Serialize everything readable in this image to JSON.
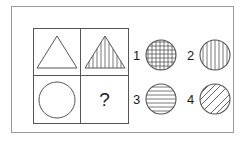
{
  "puzzle": {
    "type": "visual-analogy-matrix",
    "frame": {
      "stroke": "#9a9a9a"
    },
    "matrix": {
      "stroke": "#555555",
      "cells": [
        {
          "position": "top-left",
          "shape": "triangle",
          "fill_pattern": "none",
          "label": "triangle-outline"
        },
        {
          "position": "top-right",
          "shape": "triangle",
          "fill_pattern": "vertical-lines",
          "label": "triangle-vertical-hatch"
        },
        {
          "position": "bottom-left",
          "shape": "circle",
          "fill_pattern": "none",
          "label": "circle-outline"
        },
        {
          "position": "bottom-right",
          "shape": "question",
          "fill_pattern": "none",
          "label": "?"
        }
      ]
    },
    "options": [
      {
        "number": "1",
        "shape": "circle",
        "fill_pattern": "cross-hatch",
        "label": "circle-grid"
      },
      {
        "number": "2",
        "shape": "circle",
        "fill_pattern": "vertical-lines",
        "label": "circle-vertical-hatch"
      },
      {
        "number": "3",
        "shape": "circle",
        "fill_pattern": "horizontal-lines",
        "label": "circle-horizontal-hatch"
      },
      {
        "number": "4",
        "shape": "circle",
        "fill_pattern": "diagonal-lines",
        "label": "circle-diagonal-hatch"
      }
    ],
    "stroke_color": "#555555",
    "text_color": "#1a1a1a"
  }
}
